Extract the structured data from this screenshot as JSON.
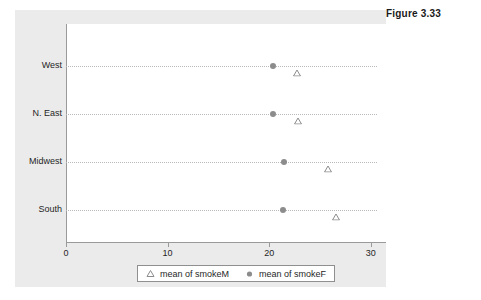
{
  "figure": {
    "caption": "Figure 3.33"
  },
  "colors": {
    "panel_background": "#ebebeb",
    "plot_background": "#ffffff",
    "axis": "#9a9a9a",
    "gridline": "#b9b9b9",
    "marker_smokeF": "#8c8c8c",
    "marker_smokeM": "#8c8c8c",
    "text": "#1f1f1f",
    "caption_text": "#1a1a1a"
  },
  "legend": {
    "entries": [
      {
        "label": "mean of smokeM",
        "marker": "triangle-outline-icon"
      },
      {
        "label": "mean of smokeF",
        "marker": "circle-filled-icon"
      }
    ]
  },
  "chart_data": {
    "type": "scatter",
    "title": "Figure 3.33",
    "xlabel": "",
    "ylabel": "",
    "orientation": "horizontal",
    "categories": [
      "West",
      "N. East",
      "Midwest",
      "South"
    ],
    "series": [
      {
        "name": "mean of smokeM",
        "marker": "triangle-outline-icon",
        "values": [
          22.7,
          22.8,
          25.8,
          26.6
        ]
      },
      {
        "name": "mean of smokeF",
        "marker": "circle-filled-icon",
        "values": [
          20.4,
          20.4,
          21.5,
          21.4
        ]
      }
    ],
    "xlim": [
      0,
      31.5
    ],
    "xticks": [
      0,
      10,
      20,
      30
    ],
    "xtick_labels": [
      "0",
      "10",
      "20",
      "30"
    ],
    "grid": "dotted-horizontal",
    "legend_position": "bottom"
  }
}
